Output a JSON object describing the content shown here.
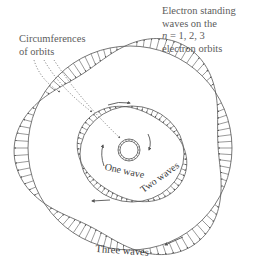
{
  "labels": {
    "title_line1": "Electron standing",
    "title_line2": "waves on the",
    "title_n": "n",
    "title_line3_rest": " = 1, 2, 3",
    "title_line4": "electron orbits",
    "circumferences_line1": "Circumferences",
    "circumferences_line2": "of orbits",
    "one_wave": "One wave",
    "two_waves": "Two waves",
    "three_waves": "Three waves"
  },
  "orbits": [
    {
      "n": 1,
      "waves": 1,
      "label": "One wave"
    },
    {
      "n": 2,
      "waves": 2,
      "label": "Two waves"
    },
    {
      "n": 3,
      "waves": 3,
      "label": "Three waves"
    }
  ],
  "colors": {
    "line": "#555555",
    "text": "#5c5c5c",
    "background": "#ffffff"
  }
}
